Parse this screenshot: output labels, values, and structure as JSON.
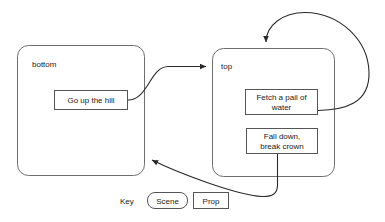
{
  "diagram": {
    "scenes": [
      {
        "id": "bottom",
        "label": "bottom"
      },
      {
        "id": "top",
        "label": "top"
      }
    ],
    "props": [
      {
        "id": "go-up-the-hill",
        "lines": [
          "Go up the hill"
        ]
      },
      {
        "id": "fetch-a-pail-of-water",
        "lines": [
          "Fetch a pail of",
          "water"
        ]
      },
      {
        "id": "fall-down-break-crown",
        "lines": [
          "Fall down,",
          "break crown"
        ]
      }
    ],
    "edges": [
      {
        "id": "go-up-the-hill-to-top",
        "from": "go-up-the-hill",
        "to": "top"
      },
      {
        "id": "fetch-a-pail-of-water-to-top",
        "from": "fetch-a-pail-of-water",
        "to": "top"
      },
      {
        "id": "fall-down-break-crown-to-bottom",
        "from": "fall-down-break-crown",
        "to": "bottom"
      }
    ]
  },
  "legend": {
    "title": "Key",
    "scene_label": "Scene",
    "prop_label": "Prop"
  },
  "colors": {
    "scene_stroke": "#6e6e6e",
    "prop_stroke": "#555555",
    "edge_stroke": "#2a2a2a",
    "text": "#1a1a1a",
    "background": "#ffffff"
  }
}
